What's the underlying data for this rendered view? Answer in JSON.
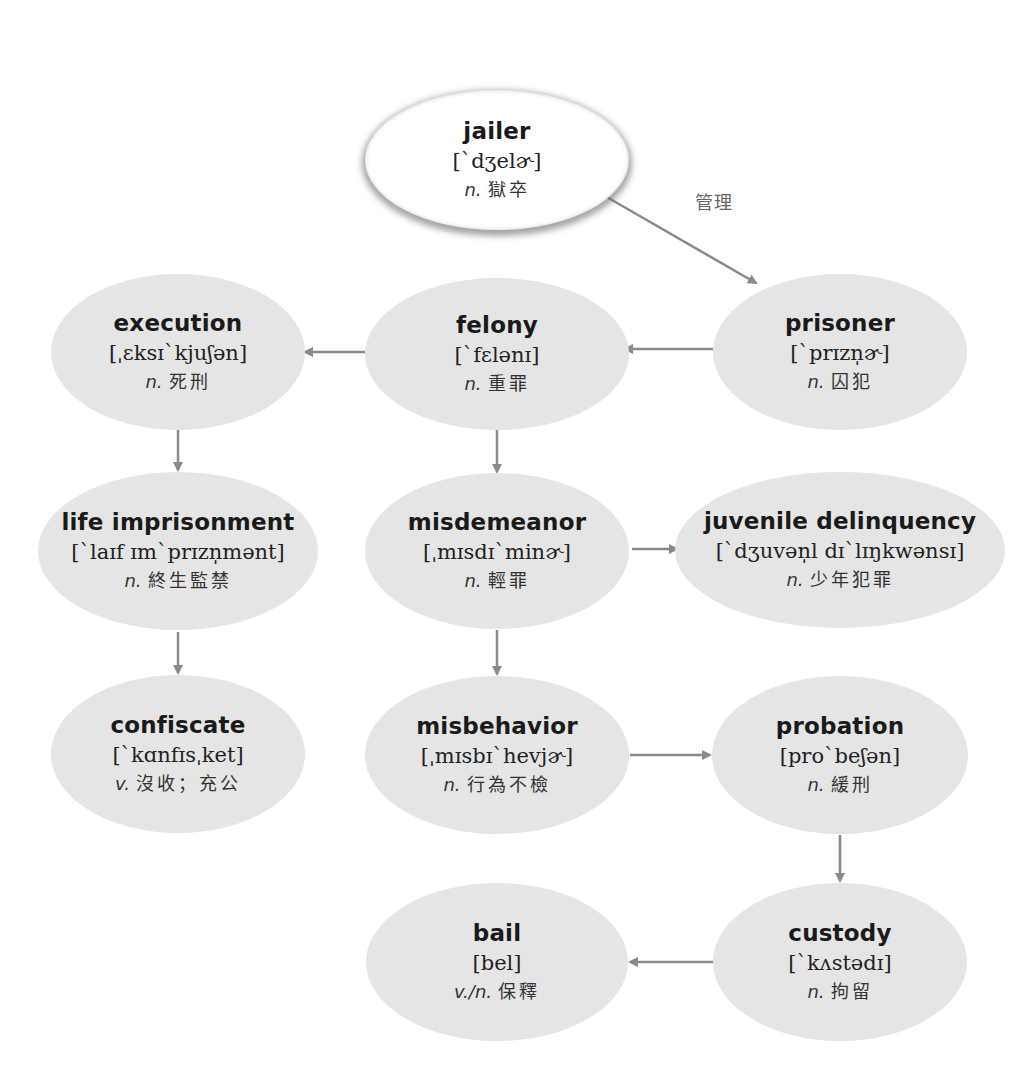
{
  "diagram": {
    "colors": {
      "node_fill": "#e5e5e5",
      "root_fill": "#ffffff",
      "arrow": "#8a8a8a",
      "text": "#1a1a1a"
    },
    "nodes": [
      {
        "id": "jailer",
        "word": "jailer",
        "ipa": "[`dʒelɚ]",
        "pos": "n.",
        "meaning": "獄卒",
        "cx": 497,
        "cy": 160,
        "rx": 132,
        "ry": 70,
        "root": true
      },
      {
        "id": "prisoner",
        "word": "prisoner",
        "ipa": "[`prɪzn̩ɚ]",
        "pos": "n.",
        "meaning": "囚犯",
        "cx": 840,
        "cy": 352,
        "rx": 127,
        "ry": 78
      },
      {
        "id": "felony",
        "word": "felony",
        "ipa": "[`fɛlənɪ]",
        "pos": "n.",
        "meaning": "重罪",
        "cx": 497,
        "cy": 354,
        "rx": 132,
        "ry": 76
      },
      {
        "id": "execution",
        "word": "execution",
        "ipa": "[ˌɛksɪ`kjuʃən]",
        "pos": "n.",
        "meaning": "死刑",
        "cx": 178,
        "cy": 352,
        "rx": 127,
        "ry": 78
      },
      {
        "id": "life_imprisonment",
        "word": "life imprisonment",
        "ipa": "[`laɪf ɪm`prɪzn̩mənt]",
        "pos": "n.",
        "meaning": "終生監禁",
        "cx": 178,
        "cy": 551,
        "rx": 140,
        "ry": 79
      },
      {
        "id": "misdemeanor",
        "word": "misdemeanor",
        "ipa": "[ˌmɪsdɪ`minɚ]",
        "pos": "n.",
        "meaning": "輕罪",
        "cx": 497,
        "cy": 551,
        "rx": 132,
        "ry": 78
      },
      {
        "id": "juvenile_delinquency",
        "word": "juvenile delinquency",
        "ipa": "[`dʒuvən̩l dɪ`lɪŋkwənsɪ]",
        "pos": "n.",
        "meaning": "少年犯罪",
        "cx": 840,
        "cy": 550,
        "rx": 165,
        "ry": 78
      },
      {
        "id": "confiscate",
        "word": "confiscate",
        "ipa": "[`kɑnfɪsˌket]",
        "pos": "v.",
        "meaning": "沒收；充公",
        "cx": 178,
        "cy": 754,
        "rx": 127,
        "ry": 79
      },
      {
        "id": "misbehavior",
        "word": "misbehavior",
        "ipa": "[ˌmɪsbɪ`hevjɚ]",
        "pos": "n.",
        "meaning": "行為不檢",
        "cx": 497,
        "cy": 755,
        "rx": 132,
        "ry": 79
      },
      {
        "id": "probation",
        "word": "probation",
        "ipa": "[pro`beʃən]",
        "pos": "n.",
        "meaning": "緩刑",
        "cx": 840,
        "cy": 755,
        "rx": 128,
        "ry": 79
      },
      {
        "id": "bail",
        "word": "bail",
        "ipa": "[bel]",
        "pos": "v./n.",
        "meaning": "保釋",
        "cx": 497,
        "cy": 962,
        "rx": 131,
        "ry": 79
      },
      {
        "id": "custody",
        "word": "custody",
        "ipa": "[`kʌstədɪ]",
        "pos": "n.",
        "meaning": "拘留",
        "cx": 840,
        "cy": 962,
        "rx": 127,
        "ry": 79
      }
    ],
    "edges": [
      {
        "from": "jailer",
        "to": "prisoner",
        "x1": 605,
        "y1": 196,
        "x2": 756,
        "y2": 283,
        "label": "管理",
        "label_x": 695,
        "label_y": 188
      },
      {
        "from": "prisoner",
        "to": "felony",
        "x1": 713,
        "y1": 349,
        "x2": 625,
        "y2": 349
      },
      {
        "from": "felony",
        "to": "execution",
        "x1": 365,
        "y1": 352,
        "x2": 305,
        "y2": 352
      },
      {
        "from": "execution",
        "to": "life_imprisonment",
        "x1": 178,
        "y1": 430,
        "x2": 178,
        "y2": 470
      },
      {
        "from": "felony",
        "to": "misdemeanor",
        "x1": 497,
        "y1": 430,
        "x2": 497,
        "y2": 472
      },
      {
        "from": "misdemeanor",
        "to": "juvenile_delinquency",
        "x1": 632,
        "y1": 549,
        "x2": 677,
        "y2": 549
      },
      {
        "from": "life_imprisonment",
        "to": "confiscate",
        "x1": 178,
        "y1": 632,
        "x2": 178,
        "y2": 673
      },
      {
        "from": "misdemeanor",
        "to": "misbehavior",
        "x1": 497,
        "y1": 630,
        "x2": 497,
        "y2": 674
      },
      {
        "from": "misbehavior",
        "to": "probation",
        "x1": 630,
        "y1": 755,
        "x2": 710,
        "y2": 755
      },
      {
        "from": "probation",
        "to": "custody",
        "x1": 840,
        "y1": 835,
        "x2": 840,
        "y2": 881
      },
      {
        "from": "custody",
        "to": "bail",
        "x1": 713,
        "y1": 962,
        "x2": 630,
        "y2": 962
      }
    ]
  }
}
